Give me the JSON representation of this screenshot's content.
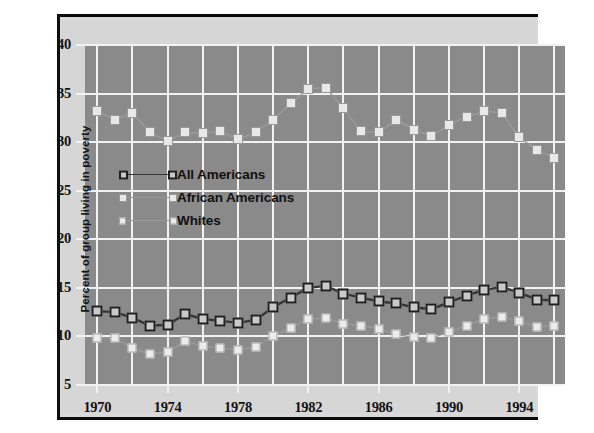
{
  "chart_data": {
    "type": "line",
    "title": "",
    "xlabel": "",
    "ylabel": "Percent of group living in poverty",
    "xlim": [
      1969.3,
      1996.6
    ],
    "ylim": [
      5,
      40
    ],
    "xtick_labels": [
      "1970",
      "1974",
      "1978",
      "1982",
      "1986",
      "1990",
      "1994"
    ],
    "xtick_values": [
      1970,
      1974,
      1978,
      1982,
      1986,
      1990,
      1994
    ],
    "ytick_labels": [
      "5",
      "10",
      "15",
      "20",
      "25",
      "30",
      "35",
      "40"
    ],
    "ytick_values": [
      5,
      10,
      15,
      20,
      25,
      30,
      35,
      40
    ],
    "grid": true,
    "legend_position": "center-left",
    "x": [
      1970,
      1971,
      1972,
      1973,
      1974,
      1975,
      1976,
      1977,
      1978,
      1979,
      1980,
      1981,
      1982,
      1983,
      1984,
      1985,
      1986,
      1987,
      1988,
      1989,
      1990,
      1991,
      1992,
      1993,
      1994,
      1995,
      1996
    ],
    "series": [
      {
        "name": "All Americans",
        "color": "#3a3a3a",
        "marker": "square-open-dark",
        "values": [
          12.6,
          12.5,
          11.9,
          11.1,
          11.2,
          12.3,
          11.8,
          11.6,
          11.4,
          11.7,
          13.0,
          14.0,
          15.0,
          15.2,
          14.4,
          14.0,
          13.6,
          13.4,
          13.0,
          12.8,
          13.5,
          14.2,
          14.8,
          15.1,
          14.5,
          13.8,
          13.7
        ]
      },
      {
        "name": "African Americans",
        "color": "#d8d8d8",
        "marker": "square-light",
        "values": [
          33.2,
          32.3,
          33.0,
          31.0,
          30.1,
          31.0,
          30.9,
          31.1,
          30.3,
          31.0,
          32.3,
          34.0,
          35.5,
          35.6,
          33.5,
          31.1,
          31.0,
          32.3,
          31.3,
          30.6,
          31.8,
          32.6,
          33.2,
          33.0,
          30.5,
          29.2,
          28.4
        ]
      },
      {
        "name": "Whites",
        "color": "#e4e4e4",
        "marker": "square-light",
        "values": [
          9.8,
          9.8,
          8.8,
          8.2,
          8.4,
          9.5,
          9.0,
          8.8,
          8.6,
          8.9,
          10.0,
          10.9,
          11.8,
          11.9,
          11.3,
          11.1,
          10.8,
          10.2,
          9.9,
          9.8,
          10.5,
          11.1,
          11.8,
          12.0,
          11.6,
          11.0,
          11.1
        ]
      }
    ]
  },
  "legend": {
    "items": [
      {
        "label": "All Americans"
      },
      {
        "label": "African Americans"
      },
      {
        "label": "Whites"
      }
    ]
  },
  "colors": {
    "plot_background": "#8a8a8a",
    "figure_background": "#d6d6d6",
    "gridline": "#f2f2f2",
    "rule": "#0a0a0a"
  }
}
